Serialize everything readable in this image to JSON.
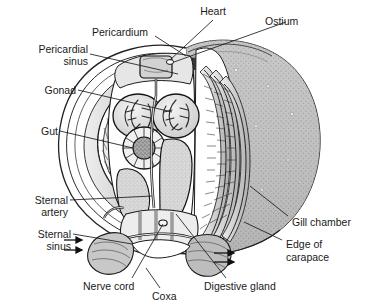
{
  "figure": {
    "kind": "anatomical-cross-section",
    "background_color": "#ffffff",
    "line_color": "#1a1a1a",
    "carapace_fill": "#b9b9b9",
    "gill_fill": "#d6d6d6",
    "organ_fill": "#e8e8e8",
    "dark_sinus_fill": "#4a4a4a",
    "label_color": "#1a1a1a"
  },
  "labels": [
    {
      "id": "heart",
      "text": "Heart",
      "align": "center"
    },
    {
      "id": "ostium",
      "text": "Ostium",
      "align": "left"
    },
    {
      "id": "pericardium",
      "text": "Pericardium",
      "align": "left"
    },
    {
      "id": "pericardial",
      "text": "Pericardial",
      "align": "right"
    },
    {
      "id": "sinus_top",
      "text": "sinus",
      "align": "right"
    },
    {
      "id": "gonad",
      "text": "Gonad",
      "align": "right"
    },
    {
      "id": "gut",
      "text": "Gut",
      "align": "right"
    },
    {
      "id": "sternal_artery_1",
      "text": "Sternal",
      "align": "right"
    },
    {
      "id": "sternal_artery_2",
      "text": "artery",
      "align": "right"
    },
    {
      "id": "sternal_sinus_1",
      "text": "Sternal",
      "align": "right"
    },
    {
      "id": "sternal_sinus_2",
      "text": "sinus",
      "align": "right"
    },
    {
      "id": "nerve_cord",
      "text": "Nerve cord",
      "align": "left"
    },
    {
      "id": "coxa",
      "text": "Coxa",
      "align": "left"
    },
    {
      "id": "digestive_gland",
      "text": "Digestive gland",
      "align": "left"
    },
    {
      "id": "gill_chamber",
      "text": "Gill chamber",
      "align": "left"
    },
    {
      "id": "edge_of",
      "text": "Edge of",
      "align": "left"
    },
    {
      "id": "carapace",
      "text": "carapace",
      "align": "left"
    }
  ],
  "structures": [
    {
      "id": "carapace-dome",
      "name": "carapace"
    },
    {
      "id": "gill-chamber-right",
      "name": "gill chamber"
    },
    {
      "id": "gill-lamellae-left",
      "name": "gill lamellae"
    },
    {
      "id": "gill-lamellae-right",
      "name": "gill lamellae"
    },
    {
      "id": "heart-organ",
      "name": "heart"
    },
    {
      "id": "pericardial-sinus",
      "name": "pericardial sinus"
    },
    {
      "id": "gonad-organ",
      "name": "gonad"
    },
    {
      "id": "gut-organ",
      "name": "gut"
    },
    {
      "id": "digestive-gland-organ",
      "name": "digestive gland"
    },
    {
      "id": "sternal-artery-vessel",
      "name": "sternal artery"
    },
    {
      "id": "sternal-sinus-cavity",
      "name": "sternal sinus"
    },
    {
      "id": "nerve-cord-organ",
      "name": "nerve cord"
    },
    {
      "id": "coxa-segment",
      "name": "coxa"
    },
    {
      "id": "flow-arrows",
      "name": "water flow arrows"
    }
  ]
}
